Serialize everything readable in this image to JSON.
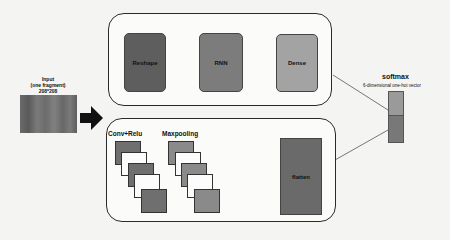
{
  "input": {
    "title": "Input",
    "subtitle": "(one fragment)",
    "size": "208*208"
  },
  "rnn_branch": {
    "blocks": [
      {
        "label": "Reshape",
        "color": "#5e5e5e"
      },
      {
        "label": "RNN",
        "color": "#7c7c7c"
      },
      {
        "label": "Dense",
        "color": "#a3a3a3"
      }
    ]
  },
  "cnn_branch": {
    "conv_label": "Conv+Relu",
    "pool_label": "Maxpooling",
    "flatten_label": "flatten"
  },
  "output": {
    "title": "softmax",
    "subtitle": "6-dimensional one-hot vector"
  }
}
